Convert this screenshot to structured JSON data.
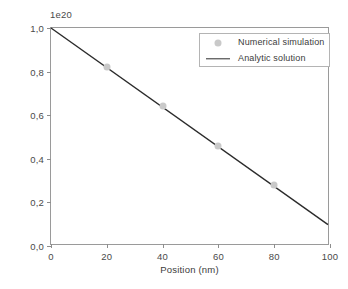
{
  "chart_data": {
    "type": "line",
    "title": "",
    "xlabel": "Position (nm)",
    "ylabel": "Concentration (cm",
    "ylabel_exponent": "-3",
    "ylabel_suffix": ")",
    "offset_text": "1e20",
    "xlim": [
      0,
      100
    ],
    "ylim": [
      0.0,
      1.0
    ],
    "xticks": [
      0,
      20,
      40,
      60,
      80,
      100
    ],
    "xtick_labels": [
      "0",
      "20",
      "40",
      "60",
      "80",
      "100"
    ],
    "yticks": [
      0.0,
      0.2,
      0.4,
      0.6,
      0.8,
      1.0
    ],
    "ytick_labels": [
      "0,0",
      "0,2",
      "0,4",
      "0,6",
      "0,8",
      "1,0"
    ],
    "grid": false,
    "legend_position": "upper right",
    "series": [
      {
        "name": "Numerical simulation",
        "style": "marker",
        "color": "#c9c9c9",
        "x": [
          20,
          40,
          60,
          80
        ],
        "values": [
          0.82,
          0.64,
          0.46,
          0.28
        ]
      },
      {
        "name": "Analytic solution",
        "style": "line",
        "color": "#2b2b2b",
        "x": [
          0,
          100
        ],
        "values": [
          1.0,
          0.09
        ]
      }
    ]
  },
  "legend": {
    "items": [
      {
        "label": "Numerical simulation",
        "marker": "circle-marker-icon"
      },
      {
        "label": "Analytic solution",
        "marker": "line-swatch-icon"
      }
    ]
  }
}
